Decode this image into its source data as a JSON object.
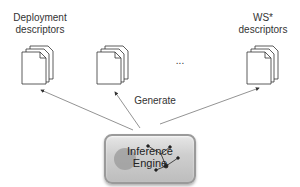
{
  "diagram": {
    "nodes": [
      {
        "id": "deployment",
        "label_line1": "Deployment",
        "label_line2": "descriptors"
      },
      {
        "id": "middle",
        "label_line1": "",
        "label_line2": ""
      },
      {
        "id": "ws",
        "label_line1": "WS*",
        "label_line2": "descriptors"
      }
    ],
    "ellipsis": "...",
    "edge_label": "Generate",
    "engine": {
      "line1": "Inference",
      "line2": "Engine"
    },
    "colors": {
      "line": "#777777",
      "stroke": "#333333",
      "engine_bg": "#cfcfcf"
    }
  }
}
